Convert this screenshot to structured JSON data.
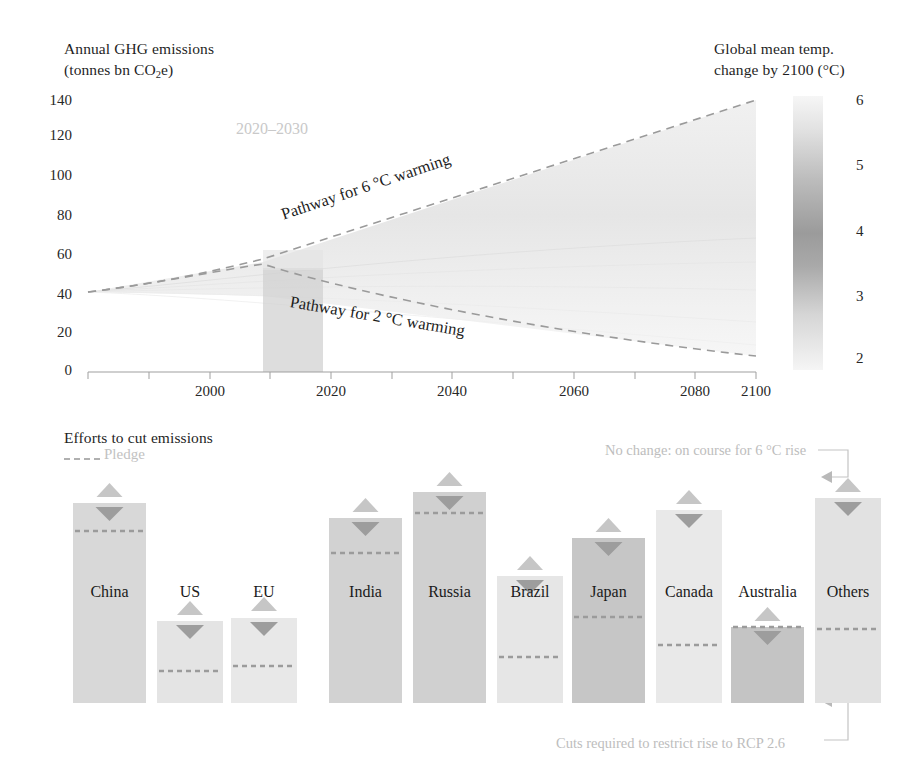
{
  "top_chart": {
    "y_axis_title_line1": "Annual GHG emissions",
    "y_axis_title_line2_pre": "(tonnes bn CO",
    "y_axis_title_line2_sub": "2",
    "y_axis_title_line2_post": "e)",
    "right_axis_title_line1": "Global mean temp.",
    "right_axis_title_line2": "change by 2100 (°C)",
    "y_ticks": [
      "140",
      "120",
      "100",
      "80",
      "60",
      "40",
      "20",
      "0"
    ],
    "x_ticks": [
      "2000",
      "2020",
      "2040",
      "2060",
      "2080",
      "2100"
    ],
    "right_ticks": [
      "6",
      "5",
      "4",
      "3",
      "2"
    ],
    "band_label": "2020–2030",
    "label_pathway_6": "Pathway for 6 °C warming",
    "label_pathway_2": "Pathway for 2 °C warming"
  },
  "bottom_chart": {
    "title": "Efforts to cut emissions",
    "legend_pledge": "Pledge",
    "annotation_top": "No change: on course for 6 °C rise",
    "annotation_bottom": "Cuts required to restrict rise to RCP 2.6"
  },
  "colors": {
    "ink": "#2b2b2b",
    "bar_light": "#dcdcdc",
    "bar_mid": "#c8c8c8",
    "bar_dark": "#b4b4b4",
    "dash": "#9e9e9e",
    "annotation": "#bdbdbd",
    "band": "#cfcfcf"
  },
  "chart_data": [
    {
      "type": "line",
      "title": "Annual GHG emissions and global mean temperature change by 2100",
      "xlabel": "",
      "ylabel": "Annual GHG emissions (tonnes bn CO2e)",
      "xlim": [
        1990,
        2100
      ],
      "ylim": [
        0,
        140
      ],
      "xticks": [
        2000,
        2020,
        2040,
        2060,
        2080,
        2100
      ],
      "yticks": [
        0,
        20,
        40,
        60,
        80,
        100,
        120,
        140
      ],
      "right_axis": {
        "label": "Global mean temp. change by 2100 (°C)",
        "lim": [
          2,
          6
        ],
        "ticks": [
          2,
          3,
          4,
          5,
          6
        ]
      },
      "grid": false,
      "legend": "inline-annotations",
      "shaded_band": {
        "label": "2020–2030",
        "x_from": 2020,
        "x_to": 2030
      },
      "series": [
        {
          "name": "Pathway for 6 °C warming",
          "style": "dashed",
          "x": [
            1990,
            2000,
            2010,
            2020,
            2030,
            2040,
            2050,
            2060,
            2070,
            2080,
            2090,
            2100
          ],
          "values": [
            38,
            41,
            47,
            55,
            64,
            74,
            84,
            94,
            105,
            116,
            126,
            135
          ]
        },
        {
          "name": "Pathway for 2 °C warming",
          "style": "dashed",
          "x": [
            1990,
            2000,
            2010,
            2020,
            2030,
            2040,
            2050,
            2060,
            2070,
            2080,
            2090,
            2100
          ],
          "values": [
            38,
            41,
            47,
            52,
            46,
            39,
            33,
            27,
            21,
            16,
            11,
            7
          ]
        }
      ]
    },
    {
      "type": "bar",
      "title": "Efforts to cut emissions",
      "xlabel": "",
      "ylabel": "",
      "categories": [
        "China",
        "US",
        "EU",
        "India",
        "Russia",
        "Brazil",
        "Japan",
        "Canada",
        "Australia",
        "Others"
      ],
      "series": [
        {
          "name": "No change: on course for 6 °C rise",
          "marker": "up-triangle",
          "values": [
            96,
            57,
            58,
            87,
            100,
            64,
            78,
            86,
            55,
            96
          ]
        },
        {
          "name": "Current emissions bar top",
          "values": [
            92,
            53,
            54,
            83,
            96,
            60,
            74,
            82,
            50,
            92
          ]
        },
        {
          "name": "Pledge",
          "style": "dashed-line",
          "values": [
            80,
            22,
            15,
            70,
            92,
            18,
            44,
            30,
            28,
            35
          ]
        },
        {
          "name": "Cuts required to restrict rise to RCP 2.6",
          "marker": "down-triangle-baseline",
          "values": [
            0,
            0,
            0,
            0,
            0,
            0,
            0,
            0,
            0,
            0
          ]
        }
      ],
      "ylim": [
        0,
        105
      ],
      "grid": false
    }
  ],
  "bars": [
    {
      "label": "China",
      "x": 73,
      "w": 73,
      "top": 503,
      "bottom": 703,
      "pledge": 531,
      "tri_up_y": 486,
      "tri_dn_y": 507,
      "shade": "#d8d8d8"
    },
    {
      "label": "US",
      "x": 157,
      "w": 66,
      "top": 621,
      "bottom": 703,
      "pledge": 671,
      "tri_up_y": 604,
      "tri_dn_y": 625,
      "shade": "#e4e4e4"
    },
    {
      "label": "EU",
      "x": 231,
      "w": 66,
      "top": 618,
      "bottom": 703,
      "pledge": 666,
      "tri_up_y": 600,
      "tri_dn_y": 622,
      "shade": "#e8e8e8"
    },
    {
      "label": "India",
      "x": 329,
      "w": 73,
      "top": 518,
      "bottom": 703,
      "pledge": 553,
      "tri_up_y": 501,
      "tri_dn_y": 522,
      "shade": "#d2d2d2"
    },
    {
      "label": "Russia",
      "x": 413,
      "w": 73,
      "top": 492,
      "bottom": 703,
      "pledge": 513,
      "tri_up_y": 475,
      "tri_dn_y": 496,
      "shade": "#d0d0d0"
    },
    {
      "label": "Brazil",
      "x": 497,
      "w": 66,
      "top": 576,
      "bottom": 703,
      "pledge": 657,
      "tri_up_y": 559,
      "tri_dn_y": 580,
      "shade": "#e6e6e6"
    },
    {
      "label": "Japan",
      "x": 572,
      "w": 73,
      "top": 538,
      "bottom": 703,
      "pledge": 617,
      "tri_up_y": 521,
      "tri_dn_y": 542,
      "shade": "#c6c6c6"
    },
    {
      "label": "Canada",
      "x": 656,
      "w": 66,
      "top": 510,
      "bottom": 703,
      "pledge": 645,
      "tri_up_y": 493,
      "tri_dn_y": 514,
      "shade": "#e9e9e9"
    },
    {
      "label": "Australia",
      "x": 731,
      "w": 73,
      "top": 627,
      "bottom": 703,
      "pledge": 627,
      "tri_up_y": 610,
      "tri_dn_y": 631,
      "shade": "#c4c4c4"
    },
    {
      "label": "Others",
      "x": 815,
      "w": 66,
      "top": 498,
      "bottom": 703,
      "pledge": 629,
      "tri_up_y": 481,
      "tri_dn_y": 502,
      "shade": "#e2e2e2"
    }
  ]
}
